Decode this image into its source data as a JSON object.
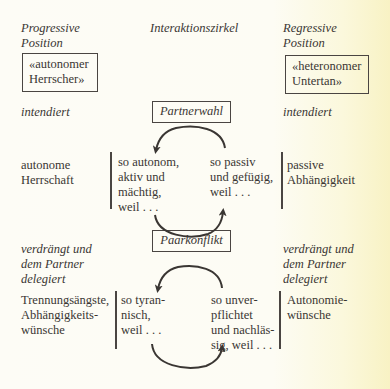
{
  "headers": {
    "left": "Progressive\nPosition",
    "center": "Interaktionszirkel",
    "right": "Regressive\nPosition"
  },
  "roles": {
    "left": "«autonomer\nHerrscher»",
    "right": "«heteronomer\nUntertan»"
  },
  "section1": {
    "left_label": "intendiert",
    "right_label": "intendiert",
    "center_label": "Partnerwahl",
    "left_outcome": "autonome\nHerrschaft",
    "cycle_left": "so autonom,\naktiv und\nmächtig,\nweil . . .",
    "cycle_right": "so passiv\nund gefügig,\nweil . . .",
    "right_outcome": "passive\nAbhängigkeit"
  },
  "section2": {
    "left_label": "verdrängt und\ndem Partner\ndelegiert",
    "right_label": "verdrängt und\ndem Partner\ndelegiert",
    "center_label": "Paarkonflikt",
    "left_outcome": "Trennungsängste,\nAbhängigkeits-\nwünsche",
    "cycle_left": "so tyran-\nnisch,\nweil . . .",
    "cycle_right": "so unver-\npflichtet\nund nachläs-\nsig, weil . . .",
    "right_outcome": "Autonomie-\nwünsche"
  },
  "colors": {
    "ink": "#3a3633",
    "paper": "#fdfcf6"
  }
}
